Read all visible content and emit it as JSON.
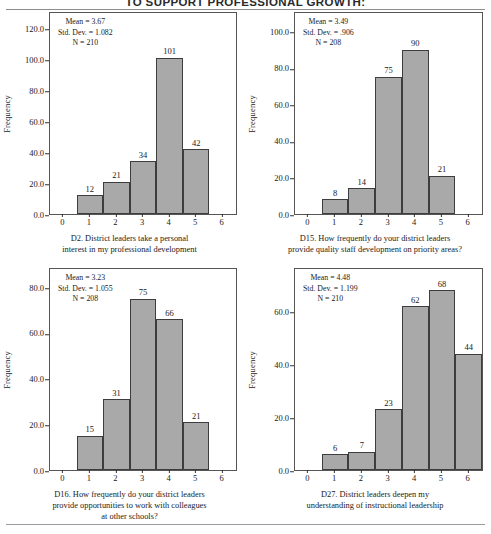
{
  "document": {
    "title": "TO SUPPORT PROFESSIONAL GROWTH:",
    "y_axis_label": "Frequency"
  },
  "chart_data": [
    {
      "id": "d2",
      "type": "bar",
      "title": "",
      "caption_lines": [
        "D2. District leaders take a personal",
        "interest in my professional development"
      ],
      "stats": {
        "mean_label": "Mean = 3.67",
        "std_label": "Std. Dev. = 1.082",
        "n_label": "N = 210",
        "mean": 3.67,
        "std_dev": 1.082,
        "n": 210
      },
      "categories": [
        "1",
        "2",
        "3",
        "4",
        "5"
      ],
      "values": [
        12,
        21,
        34,
        101,
        42
      ],
      "xlabel": "",
      "ylabel": "Frequency",
      "xticks": [
        "0",
        "1",
        "2",
        "3",
        "4",
        "5",
        "6"
      ],
      "yticks": [
        "0.0",
        "20.0",
        "40.0",
        "60.0",
        "80.0",
        "100.0",
        "120.0"
      ],
      "xlim": [
        -0.5,
        6.5
      ],
      "ylim": [
        0,
        130
      ],
      "grid": false,
      "legend": "none",
      "bar_color": "#a9a9a9",
      "bar_edge_color": "#3d3d3d"
    },
    {
      "id": "d15",
      "type": "bar",
      "title": "",
      "caption_lines": [
        "D15. How frequently do your district leaders",
        "provide quality staff development on priority areas?"
      ],
      "stats": {
        "mean_label": "Mean = 3.49",
        "std_label": "Std. Dev. = .906",
        "n_label": "N = 208",
        "mean": 3.49,
        "std_dev": 0.906,
        "n": 208
      },
      "categories": [
        "1",
        "2",
        "3",
        "4",
        "5"
      ],
      "values": [
        8,
        14,
        75,
        90,
        21
      ],
      "xlabel": "",
      "ylabel": "Frequency",
      "xticks": [
        "0",
        "1",
        "2",
        "3",
        "4",
        "5",
        "6"
      ],
      "yticks": [
        "0.0",
        "20.0",
        "40.0",
        "60.0",
        "80.0",
        "100.0"
      ],
      "xlim": [
        -0.5,
        6.5
      ],
      "ylim": [
        0,
        110
      ],
      "grid": false,
      "legend": "none",
      "bar_color": "#a9a9a9",
      "bar_edge_color": "#3d3d3d"
    },
    {
      "id": "d16",
      "type": "bar",
      "title": "",
      "caption_lines": [
        "D16. How frequently do your district leaders",
        "provide opportunities to work with colleagues",
        "at other schools?"
      ],
      "stats": {
        "mean_label": "Mean = 3.23",
        "std_label": "Std. Dev. = 1.055",
        "n_label": "N = 208",
        "mean": 3.23,
        "std_dev": 1.055,
        "n": 208
      },
      "categories": [
        "1",
        "2",
        "3",
        "4",
        "5"
      ],
      "values": [
        15,
        31,
        75,
        66,
        21
      ],
      "xlabel": "",
      "ylabel": "Frequency",
      "xticks": [
        "0",
        "1",
        "2",
        "3",
        "4",
        "5",
        "6"
      ],
      "yticks": [
        "0.0",
        "20.0",
        "40.0",
        "60.0",
        "80.0"
      ],
      "xlim": [
        -0.5,
        6.5
      ],
      "ylim": [
        0,
        88
      ],
      "grid": false,
      "legend": "none",
      "bar_color": "#a9a9a9",
      "bar_edge_color": "#3d3d3d"
    },
    {
      "id": "d27",
      "type": "bar",
      "title": "",
      "caption_lines": [
        "D27. District leaders deepen my",
        "understanding of instructional leadership"
      ],
      "stats": {
        "mean_label": "Mean = 4.48",
        "std_label": "Std. Dev. = 1.199",
        "n_label": "N = 210",
        "mean": 4.48,
        "std_dev": 1.199,
        "n": 210
      },
      "categories": [
        "1",
        "2",
        "3",
        "4",
        "5",
        "6"
      ],
      "values": [
        6,
        7,
        23,
        62,
        68,
        44
      ],
      "xlabel": "",
      "ylabel": "Frequency",
      "xticks": [
        "0",
        "1",
        "2",
        "3",
        "4",
        "5",
        "6"
      ],
      "yticks": [
        "0.0",
        "20.0",
        "40.0",
        "60.0"
      ],
      "xlim": [
        -0.5,
        6.5
      ],
      "ylim": [
        0,
        76
      ],
      "grid": false,
      "legend": "none",
      "bar_color": "#a9a9a9",
      "bar_edge_color": "#3d3d3d"
    }
  ]
}
